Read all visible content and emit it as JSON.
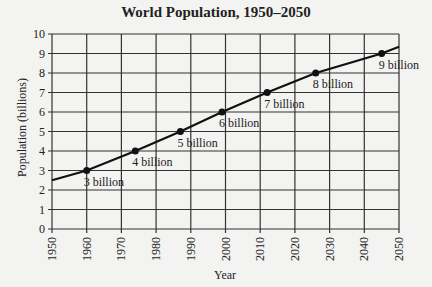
{
  "chart_data": {
    "type": "line",
    "title": "World Population, 1950–2050",
    "xlabel": "Year",
    "ylabel": "Population (billions)",
    "xlim": [
      1950,
      2050
    ],
    "ylim": [
      0,
      10
    ],
    "x_ticks": [
      1950,
      1960,
      1970,
      1980,
      1990,
      2000,
      2010,
      2020,
      2030,
      2040,
      2050
    ],
    "y_ticks": [
      0,
      1,
      2,
      3,
      4,
      5,
      6,
      7,
      8,
      9,
      10
    ],
    "grid": true,
    "line": {
      "x": [
        1950,
        1960,
        1974,
        1987,
        1999,
        2012,
        2026,
        2045,
        2050
      ],
      "y": [
        2.5,
        3,
        4,
        5,
        6,
        7,
        8,
        9,
        9.35
      ]
    },
    "points": [
      {
        "x": 1960,
        "y": 3,
        "label": "3 billion"
      },
      {
        "x": 1974,
        "y": 4,
        "label": "4 billion"
      },
      {
        "x": 1987,
        "y": 5,
        "label": "5 billion"
      },
      {
        "x": 1999,
        "y": 6,
        "label": "6 billion"
      },
      {
        "x": 2012,
        "y": 7,
        "label": "7 billion"
      },
      {
        "x": 2026,
        "y": 8,
        "label": "8 billion"
      },
      {
        "x": 2045,
        "y": 9,
        "label": "9 billion"
      }
    ]
  }
}
